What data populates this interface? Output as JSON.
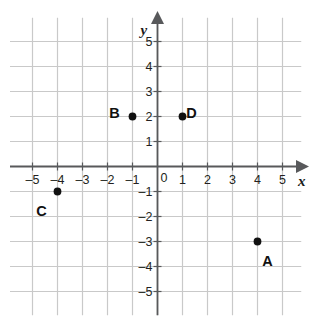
{
  "chart_data": {
    "type": "scatter",
    "title": "",
    "xlabel": "x",
    "ylabel": "y",
    "xlim": [
      -5.8,
      5.8
    ],
    "ylim": [
      -5.9,
      5.9
    ],
    "grid": true,
    "grid_spacing": 1,
    "legend": "none",
    "axis_arrows": [
      "x-positive",
      "y-positive"
    ],
    "origin_label": "0",
    "xticks": [
      -5,
      -4,
      -3,
      -2,
      -1,
      1,
      2,
      3,
      4,
      5
    ],
    "xtick_labels": [
      "–5",
      "–4",
      "–3",
      "–2",
      "–1",
      "1",
      "2",
      "3",
      "4",
      "5"
    ],
    "yticks": [
      5,
      4,
      3,
      2,
      1,
      -1,
      -2,
      -3,
      -4,
      -5
    ],
    "ytick_labels": [
      "5",
      "4",
      "3",
      "2",
      "1",
      "–1",
      "–2",
      "–3",
      "–4",
      "–5"
    ],
    "points": [
      {
        "label": "A",
        "x": 4,
        "y": -3,
        "label_dx": 10,
        "label_dy": 12
      },
      {
        "label": "B",
        "x": -1,
        "y": 2,
        "label_dx": -18,
        "label_dy": -11
      },
      {
        "label": "C",
        "x": -4,
        "y": -1,
        "label_dx": -16,
        "label_dy": 12
      },
      {
        "label": "D",
        "x": 1,
        "y": 2,
        "label_dx": 9,
        "label_dy": -11
      }
    ]
  },
  "style": {
    "grid_color": "#c9c9c9",
    "axis_color": "#58595b",
    "point_color": "#111111",
    "background": "#ffffff"
  }
}
